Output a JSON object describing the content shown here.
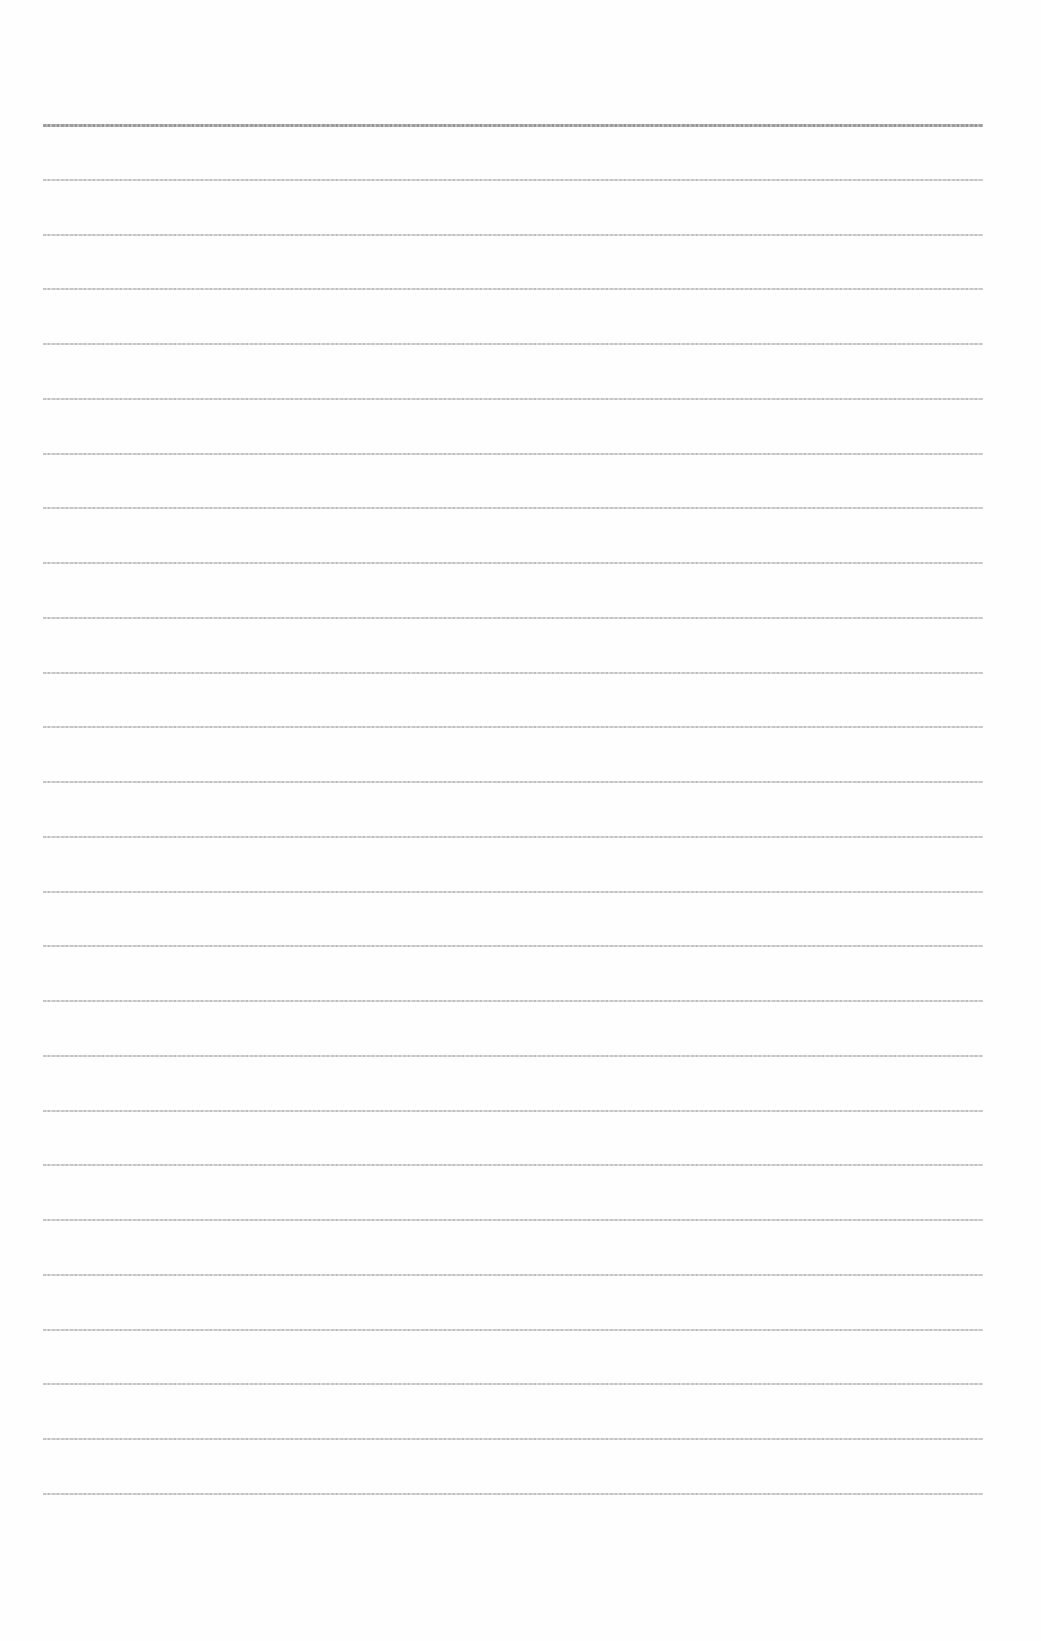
{
  "document": {
    "type": "lined-paper",
    "line_count": 26,
    "first_line_y": 124,
    "line_spacing": 54.75,
    "line_left": 43,
    "line_width": 940,
    "line_color": "#b4b4b4",
    "background_color": "#fefefe",
    "text": ""
  }
}
